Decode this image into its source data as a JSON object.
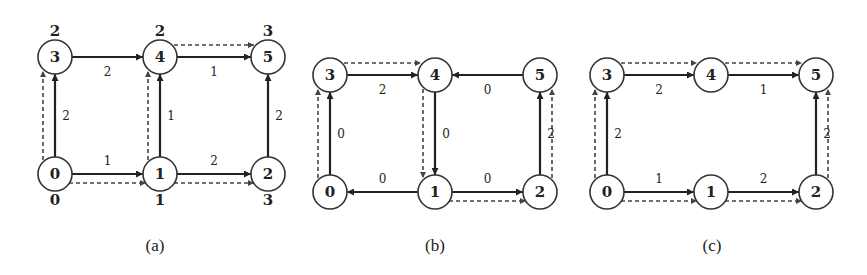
{
  "panels": [
    {
      "caption": "(a)",
      "nodes": [
        {
          "id": "0",
          "x": 55,
          "y": 174,
          "label": "0"
        },
        {
          "id": "1",
          "x": 160,
          "y": 174,
          "label": "1"
        },
        {
          "id": "2",
          "x": 268,
          "y": 174,
          "label": "2"
        },
        {
          "id": "3",
          "x": 55,
          "y": 57,
          "label": "3"
        },
        {
          "id": "4",
          "x": 160,
          "y": 57,
          "label": "4"
        },
        {
          "id": "5",
          "x": 268,
          "y": 57,
          "label": "5"
        }
      ],
      "node_values": {
        "0": "0",
        "1": "1",
        "2": "3",
        "3": "2",
        "4": "2",
        "5": "3"
      },
      "edges": [
        {
          "from": "0",
          "to": "1",
          "weight": "1"
        },
        {
          "from": "1",
          "to": "2",
          "weight": "2"
        },
        {
          "from": "0",
          "to": "3",
          "weight": "2"
        },
        {
          "from": "1",
          "to": "4",
          "weight": "1"
        },
        {
          "from": "2",
          "to": "5",
          "weight": "2"
        },
        {
          "from": "3",
          "to": "4",
          "weight": "2"
        },
        {
          "from": "4",
          "to": "5",
          "weight": "1"
        }
      ],
      "dashed_paths": [
        [
          "0",
          "3"
        ],
        [
          "0",
          "1"
        ],
        [
          "1",
          "4"
        ],
        [
          "1",
          "2"
        ],
        [
          "4",
          "5"
        ]
      ]
    },
    {
      "caption": "(b)",
      "nodes": [
        {
          "id": "0",
          "x": 330,
          "y": 192,
          "label": "0"
        },
        {
          "id": "1",
          "x": 435,
          "y": 192,
          "label": "1"
        },
        {
          "id": "2",
          "x": 540,
          "y": 192,
          "label": "2"
        },
        {
          "id": "3",
          "x": 330,
          "y": 75,
          "label": "3"
        },
        {
          "id": "4",
          "x": 435,
          "y": 75,
          "label": "4"
        },
        {
          "id": "5",
          "x": 540,
          "y": 75,
          "label": "5"
        }
      ],
      "edges": [
        {
          "from": "1",
          "to": "0",
          "weight": "0"
        },
        {
          "from": "1",
          "to": "2",
          "weight": "0"
        },
        {
          "from": "0",
          "to": "3",
          "weight": "0"
        },
        {
          "from": "4",
          "to": "1",
          "weight": "0"
        },
        {
          "from": "2",
          "to": "5",
          "weight": "2"
        },
        {
          "from": "3",
          "to": "4",
          "weight": "2"
        },
        {
          "from": "5",
          "to": "4",
          "weight": "0"
        }
      ],
      "dashed_paths": [
        [
          "0",
          "3"
        ],
        [
          "3",
          "4"
        ],
        [
          "4",
          "1"
        ],
        [
          "1",
          "2"
        ],
        [
          "2",
          "5"
        ]
      ]
    },
    {
      "caption": "(c)",
      "nodes": [
        {
          "id": "0",
          "x": 607,
          "y": 192,
          "label": "0"
        },
        {
          "id": "1",
          "x": 711,
          "y": 192,
          "label": "1"
        },
        {
          "id": "2",
          "x": 816,
          "y": 192,
          "label": "2"
        },
        {
          "id": "3",
          "x": 607,
          "y": 75,
          "label": "3"
        },
        {
          "id": "4",
          "x": 711,
          "y": 75,
          "label": "4"
        },
        {
          "id": "5",
          "x": 816,
          "y": 75,
          "label": "5"
        }
      ],
      "edges": [
        {
          "from": "0",
          "to": "1",
          "weight": "1"
        },
        {
          "from": "1",
          "to": "2",
          "weight": "2"
        },
        {
          "from": "0",
          "to": "3",
          "weight": "2"
        },
        {
          "from": "2",
          "to": "5",
          "weight": "2"
        },
        {
          "from": "3",
          "to": "4",
          "weight": "2"
        },
        {
          "from": "4",
          "to": "5",
          "weight": "1"
        }
      ],
      "dashed_paths": [
        [
          "0",
          "3"
        ],
        [
          "3",
          "4"
        ],
        [
          "4",
          "5"
        ],
        [
          "0",
          "1"
        ],
        [
          "1",
          "2"
        ],
        [
          "2",
          "5"
        ]
      ]
    }
  ]
}
